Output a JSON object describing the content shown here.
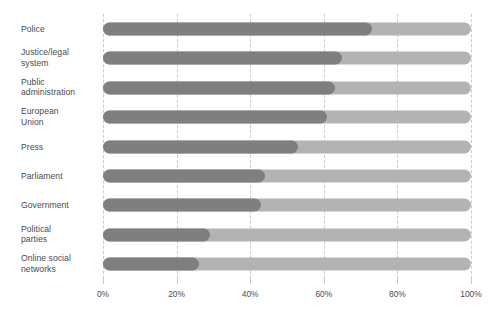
{
  "chart_data": {
    "type": "bar",
    "orientation": "horizontal",
    "stacked": true,
    "title": "",
    "subtitle": "",
    "xlabel": "",
    "ylabel": "",
    "xlim": [
      0,
      100
    ],
    "xticks": [
      0,
      20,
      40,
      60,
      80,
      100
    ],
    "xtick_labels": [
      "0%",
      "20%",
      "40%",
      "60%",
      "80%",
      "100%"
    ],
    "grid": true,
    "grid_style": "dashed-vertical",
    "legend": false,
    "legend_position": "none",
    "categories": [
      "Police",
      "Justice/legal\nsystem",
      "Public\nadministration",
      "European\nUnion",
      "Press",
      "Parliament",
      "Government",
      "Political\nparties",
      "Online social\nnetworks"
    ],
    "values": [
      73,
      65,
      63,
      61,
      53,
      44,
      43,
      29,
      26
    ],
    "remainders": [
      27,
      35,
      37,
      39,
      47,
      56,
      57,
      71,
      74
    ],
    "series": [
      {
        "name": "value",
        "color": "#7f7f7f",
        "values": [
          73,
          65,
          63,
          61,
          53,
          44,
          43,
          29,
          26
        ]
      },
      {
        "name": "remainder",
        "color": "#b3b3b3",
        "values": [
          27,
          35,
          37,
          39,
          47,
          56,
          57,
          71,
          74
        ]
      }
    ]
  },
  "colors": {
    "value_bar": "#7f7f7f",
    "remainder_bar": "#b3b3b3",
    "gridline": "#c9c9cf",
    "text": "#4a4a50",
    "background": "#ffffff"
  }
}
